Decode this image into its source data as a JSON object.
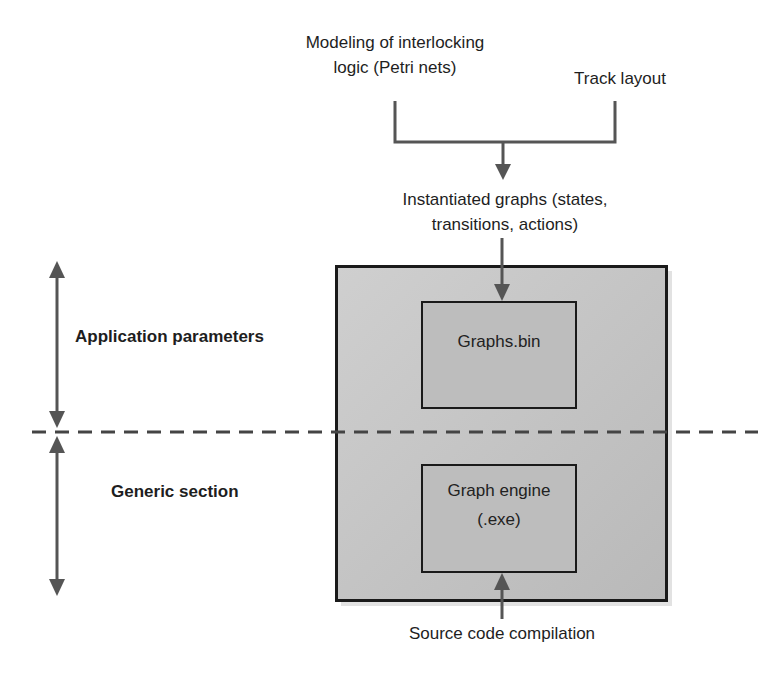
{
  "inputs": {
    "modeling": {
      "line1": "Modeling of interlocking",
      "line2": "logic (Petri nets)"
    },
    "track_layout": "Track layout"
  },
  "instantiated": {
    "line1": "Instantiated graphs (states,",
    "line2": "transitions, actions)"
  },
  "blocks": {
    "graphs_bin": "Graphs.bin",
    "graph_engine": {
      "line1": "Graph engine",
      "line2": "(.exe)"
    }
  },
  "sections": {
    "application_parameters": "Application parameters",
    "generic_section": "Generic section"
  },
  "source": "Source code compilation",
  "colors": {
    "line": "#555555",
    "border": "#1a1a1a",
    "outer_fill": "#c4c4c4",
    "inner_fill": "#bdbdbd"
  }
}
